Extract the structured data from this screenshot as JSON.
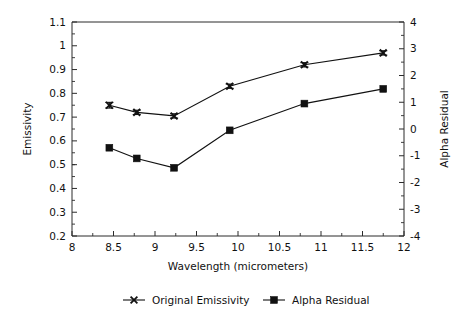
{
  "chart_data": {
    "type": "line",
    "title": "",
    "xlabel": "Wavelength (micrometers)",
    "ylabel": "Emissivity",
    "y2label": "Alpha Residual",
    "xlim": [
      8,
      12
    ],
    "ylim": [
      0.2,
      1.1
    ],
    "y2lim": [
      -4,
      4
    ],
    "grid": false,
    "legend_position": "bottom",
    "x": [
      8.45,
      8.78,
      9.23,
      9.9,
      10.8,
      11.75
    ],
    "xticks": [
      "8",
      "8.5",
      "9",
      "9.5",
      "10",
      "10.5",
      "11",
      "11.5",
      "12"
    ],
    "xtick_values": [
      8,
      8.5,
      9,
      9.5,
      10,
      10.5,
      11,
      11.5,
      12
    ],
    "xminor_step": 0.25,
    "yticks": [
      "0.2",
      "0.3",
      "0.4",
      "0.5",
      "0.6",
      "0.7",
      "0.8",
      "0.9",
      "1",
      "1.1"
    ],
    "ytick_values": [
      0.2,
      0.3,
      0.4,
      0.5,
      0.6,
      0.7,
      0.8,
      0.9,
      1.0,
      1.1
    ],
    "yminor_step": 0.05,
    "y2ticks": [
      "-4",
      "-3",
      "-2",
      "-1",
      "0",
      "1",
      "2",
      "3",
      "4"
    ],
    "y2tick_values": [
      -4,
      -3,
      -2,
      -1,
      0,
      1,
      2,
      3,
      4
    ],
    "y2minor_step": 0.5,
    "series": [
      {
        "name": "Original Emissivity",
        "axis": "left",
        "marker": "x",
        "values": [
          0.75,
          0.72,
          0.705,
          0.83,
          0.92,
          0.97
        ],
        "errors": [
          0.012,
          0.009,
          0.009,
          0.009,
          0.009,
          0.009
        ]
      },
      {
        "name": "Alpha Residual",
        "axis": "right",
        "marker": "square",
        "values": [
          -0.7,
          -1.1,
          -1.45,
          -0.05,
          0.95,
          1.5
        ],
        "errors": [
          0,
          0,
          0,
          0,
          0,
          0
        ]
      }
    ]
  },
  "legend": {
    "entries": [
      {
        "label": "Original Emissivity",
        "marker": "x-marker-icon"
      },
      {
        "label": "Alpha Residual",
        "marker": "square-marker-icon"
      }
    ]
  },
  "colors": {
    "foreground": "#111111",
    "axis": "#2b2b2b",
    "background": "#ffffff"
  }
}
